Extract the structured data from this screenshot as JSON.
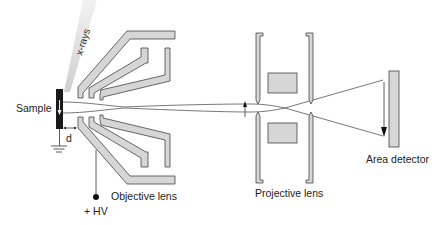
{
  "diagram": {
    "labels": {
      "sample": "Sample",
      "xrays": "x-rays",
      "distance": "d",
      "hv": "+ HV",
      "objective_lens": "Objective lens",
      "projective_lens": "Projective lens",
      "area_detector": "Area detector"
    },
    "colors": {
      "electrode_fill": "#d6d6d6",
      "outline": "#444444",
      "sample": "#1a1a1a",
      "xray_beam": "#d9d9d9",
      "text": "#222222"
    }
  }
}
